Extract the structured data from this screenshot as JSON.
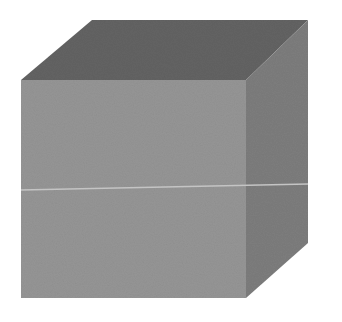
{
  "figure": {
    "colors": {
      "background": "#ffffff",
      "top_face": "#636363",
      "front_face": "#959595",
      "right_face": "#7d7d7d",
      "divider_line": "#c4c4c4"
    },
    "vertices": {
      "front_top_left": [
        21,
        80
      ],
      "front_top_right": [
        246,
        80
      ],
      "front_bottom_left": [
        21,
        298
      ],
      "front_bottom_right": [
        246,
        298
      ],
      "back_top_left": [
        92,
        20
      ],
      "back_top_right": [
        308,
        20
      ],
      "back_bottom_right": [
        308,
        243
      ]
    },
    "divider": {
      "x1": 21,
      "y1": 190,
      "x2": 308,
      "y2": 184
    }
  }
}
